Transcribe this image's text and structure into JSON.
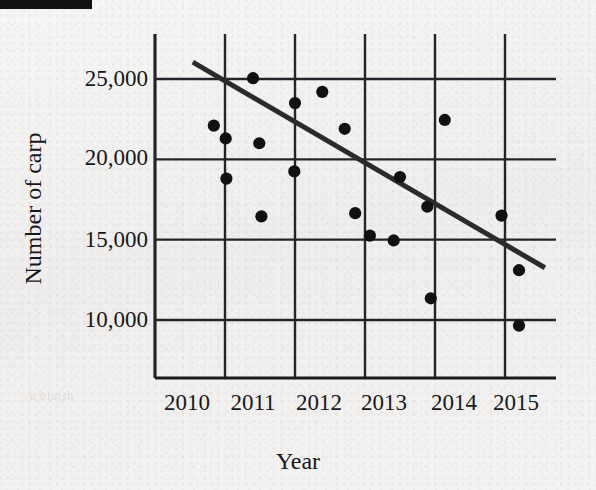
{
  "figure": {
    "background_color": "#f2f2f0",
    "ink_color": "#1a1a1c",
    "scan_artifact": "black-bar-top-left",
    "faint_background_text": "a bluish"
  },
  "chart_data": {
    "type": "scatter",
    "title": "",
    "xlabel": "Year",
    "ylabel": "Number of carp",
    "xlim": [
      2010,
      2015.6
    ],
    "ylim": [
      8400,
      26900
    ],
    "grid": true,
    "legend": false,
    "xticks": [
      2010,
      2011,
      2012,
      2013,
      2014,
      2015
    ],
    "xtick_labels": [
      "2010",
      "2011",
      "2012",
      "2013",
      "2014",
      "2015"
    ],
    "yticks": [
      10000,
      15000,
      20000,
      25000
    ],
    "ytick_labels": [
      "10,000",
      "15,000",
      "20,000",
      "25,000"
    ],
    "marker": "filled-circle",
    "marker_color": "#111114",
    "points": [
      {
        "x": 2010.84,
        "y": 22100
      },
      {
        "x": 2011.01,
        "y": 21300
      },
      {
        "x": 2011.02,
        "y": 18800
      },
      {
        "x": 2011.4,
        "y": 25050
      },
      {
        "x": 2011.49,
        "y": 21000
      },
      {
        "x": 2011.52,
        "y": 16450
      },
      {
        "x": 2011.99,
        "y": 19250
      },
      {
        "x": 2012.0,
        "y": 23500
      },
      {
        "x": 2012.39,
        "y": 24200
      },
      {
        "x": 2012.71,
        "y": 21900
      },
      {
        "x": 2012.86,
        "y": 16650
      },
      {
        "x": 2013.07,
        "y": 15250
      },
      {
        "x": 2013.41,
        "y": 14950
      },
      {
        "x": 2013.5,
        "y": 18900
      },
      {
        "x": 2013.89,
        "y": 17050
      },
      {
        "x": 2014.14,
        "y": 22450
      },
      {
        "x": 2013.94,
        "y": 11350
      },
      {
        "x": 2014.95,
        "y": 16500
      },
      {
        "x": 2015.2,
        "y": 13100
      },
      {
        "x": 2015.2,
        "y": 9650
      }
    ],
    "trendline": {
      "visible": true,
      "color": "#2b2b2e",
      "x_start": 2010.54,
      "y_start": 26050,
      "x_end": 2015.57,
      "y_end": 13250
    }
  }
}
